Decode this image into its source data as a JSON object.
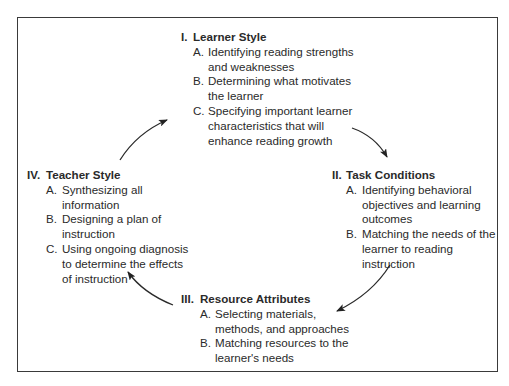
{
  "diagram": {
    "type": "cycle",
    "border_color": "#3a3a3a",
    "text_color": "#2a2a2a",
    "stages": [
      {
        "numeral": "I.",
        "title": "Learner Style",
        "items": [
          {
            "letter": "A.",
            "text": "Identifying reading strengths and weaknesses"
          },
          {
            "letter": "B.",
            "text": "Determining what motivates the learner"
          },
          {
            "letter": "C.",
            "text": "Specifying important learner characteristics that will enhance reading growth"
          }
        ]
      },
      {
        "numeral": "II.",
        "title": "Task Conditions",
        "items": [
          {
            "letter": "A.",
            "text": "Identifying behavioral objectives and learning outcomes"
          },
          {
            "letter": "B.",
            "text": "Matching the needs of the learner to reading instruction"
          }
        ]
      },
      {
        "numeral": "III.",
        "title": "Resource Attributes",
        "items": [
          {
            "letter": "A.",
            "text": "Selecting materials, methods, and approaches"
          },
          {
            "letter": "B.",
            "text": "Matching resources to the learner's needs"
          }
        ]
      },
      {
        "numeral": "IV.",
        "title": "Teacher Style",
        "items": [
          {
            "letter": "A.",
            "text": "Synthesizing all information"
          },
          {
            "letter": "B.",
            "text": "Designing a plan of instruction"
          },
          {
            "letter": "C.",
            "text": "Using ongoing diagnosis to determine the effects of instruction"
          }
        ]
      }
    ],
    "arrows": [
      {
        "from": "I. Learner Style",
        "to": "II. Task Conditions"
      },
      {
        "from": "II. Task Conditions",
        "to": "III. Resource Attributes"
      },
      {
        "from": "III. Resource Attributes",
        "to": "IV. Teacher Style"
      },
      {
        "from": "IV. Teacher Style",
        "to": "I. Learner Style"
      }
    ]
  }
}
